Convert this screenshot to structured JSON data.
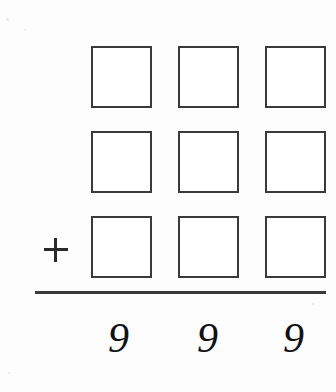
{
  "worksheet": {
    "title": "Column addition with missing addends",
    "operator": {
      "symbol": "+",
      "name": "plus"
    },
    "grid": {
      "columns": 3,
      "rows": 3,
      "column_labels": [
        "hundreds",
        "tens",
        "ones"
      ],
      "cells": [
        [
          {
            "row": 0,
            "column": 0,
            "value": "",
            "placeholder": ""
          },
          {
            "row": 0,
            "column": 1,
            "value": "",
            "placeholder": ""
          },
          {
            "row": 0,
            "column": 2,
            "value": "",
            "placeholder": ""
          }
        ],
        [
          {
            "row": 1,
            "column": 0,
            "value": "",
            "placeholder": ""
          },
          {
            "row": 1,
            "column": 1,
            "value": "",
            "placeholder": ""
          },
          {
            "row": 1,
            "column": 2,
            "value": "",
            "placeholder": ""
          }
        ],
        [
          {
            "row": 2,
            "column": 0,
            "value": "",
            "placeholder": ""
          },
          {
            "row": 2,
            "column": 1,
            "value": "",
            "placeholder": ""
          },
          {
            "row": 2,
            "column": 2,
            "value": "",
            "placeholder": ""
          }
        ]
      ]
    },
    "sum": {
      "digits": [
        "9",
        "9",
        "9"
      ],
      "text": "999"
    },
    "colors": {
      "page_background": "#fdfdfd",
      "box_border": "#3a3a3c",
      "box_fill": "#ffffff",
      "rule_line": "#3a3a3c",
      "ink": "#121214"
    }
  }
}
